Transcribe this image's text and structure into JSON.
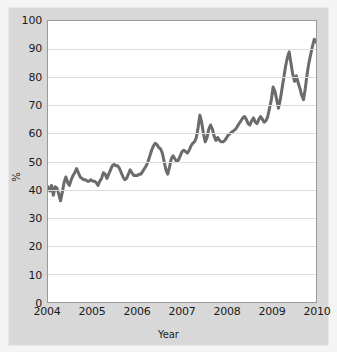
{
  "chart_data": {
    "type": "line",
    "title": "",
    "xlabel": "Year",
    "ylabel": "%",
    "xlim": [
      2004,
      2010
    ],
    "ylim": [
      0,
      100
    ],
    "grid": true,
    "legend": "none",
    "line_color": "#6b6b6b",
    "plot_background": "#ffffff",
    "panel_background": "#d8d8d8",
    "gridline_color": "#dcdcdc",
    "y_ticks": [
      0,
      10,
      20,
      30,
      40,
      50,
      60,
      70,
      80,
      90,
      100
    ],
    "y_tick_labels": [
      "0",
      "10",
      "20",
      "30",
      "40",
      "50",
      "60",
      "70",
      "80",
      "90",
      "100"
    ],
    "x_ticks": [
      2004,
      2005,
      2006,
      2007,
      2008,
      2009,
      2010
    ],
    "x_tick_labels": [
      "2004",
      "2005",
      "2006",
      "2007",
      "2008",
      "2009",
      "2010"
    ],
    "series": [
      {
        "name": "percent",
        "x": [
          2004.0,
          2004.04,
          2004.08,
          2004.12,
          2004.16,
          2004.2,
          2004.24,
          2004.28,
          2004.32,
          2004.36,
          2004.4,
          2004.44,
          2004.48,
          2004.52,
          2004.56,
          2004.6,
          2004.64,
          2004.68,
          2004.72,
          2004.76,
          2004.8,
          2004.84,
          2004.88,
          2004.92,
          2004.96,
          2005.0,
          2005.04,
          2005.08,
          2005.12,
          2005.16,
          2005.2,
          2005.24,
          2005.28,
          2005.32,
          2005.36,
          2005.4,
          2005.44,
          2005.48,
          2005.52,
          2005.56,
          2005.6,
          2005.64,
          2005.68,
          2005.72,
          2005.76,
          2005.8,
          2005.84,
          2005.88,
          2005.92,
          2005.96,
          2006.0,
          2006.04,
          2006.08,
          2006.12,
          2006.16,
          2006.2,
          2006.24,
          2006.28,
          2006.32,
          2006.36,
          2006.4,
          2006.44,
          2006.48,
          2006.52,
          2006.56,
          2006.6,
          2006.64,
          2006.68,
          2006.72,
          2006.76,
          2006.8,
          2006.84,
          2006.88,
          2006.92,
          2006.96,
          2007.0,
          2007.04,
          2007.08,
          2007.12,
          2007.16,
          2007.2,
          2007.24,
          2007.28,
          2007.32,
          2007.36,
          2007.4,
          2007.44,
          2007.48,
          2007.52,
          2007.56,
          2007.6,
          2007.64,
          2007.68,
          2007.72,
          2007.76,
          2007.8,
          2007.84,
          2007.88,
          2007.92,
          2007.96,
          2008.0,
          2008.04,
          2008.08,
          2008.12,
          2008.16,
          2008.2,
          2008.24,
          2008.28,
          2008.32,
          2008.36,
          2008.4,
          2008.44,
          2008.48,
          2008.52,
          2008.56,
          2008.6,
          2008.64,
          2008.68,
          2008.72,
          2008.76,
          2008.8,
          2008.84,
          2008.88,
          2008.92,
          2008.96,
          2009.0,
          2009.04,
          2009.08,
          2009.12,
          2009.16,
          2009.2,
          2009.24,
          2009.28,
          2009.32,
          2009.36,
          2009.4,
          2009.44,
          2009.48,
          2009.52,
          2009.56,
          2009.6,
          2009.64,
          2009.68,
          2009.72,
          2009.76,
          2009.8,
          2009.84,
          2009.88,
          2009.92,
          2009.96,
          2010.0
        ],
        "values": [
          41.0,
          39.5,
          41.5,
          38.0,
          41.0,
          40.5,
          38.5,
          36.0,
          39.0,
          42.5,
          44.5,
          42.5,
          41.5,
          43.5,
          45.0,
          46.0,
          47.5,
          46.0,
          44.5,
          44.0,
          43.5,
          43.5,
          43.0,
          43.0,
          43.5,
          43.0,
          43.0,
          42.5,
          41.5,
          43.0,
          44.0,
          46.0,
          45.5,
          44.0,
          45.5,
          47.0,
          48.5,
          49.0,
          48.5,
          48.5,
          47.5,
          46.0,
          44.5,
          43.5,
          44.0,
          45.5,
          47.0,
          46.0,
          45.0,
          45.0,
          45.0,
          45.5,
          45.5,
          46.5,
          47.5,
          48.5,
          50.0,
          52.0,
          54.0,
          55.5,
          56.5,
          56.0,
          55.0,
          54.5,
          53.0,
          50.0,
          47.0,
          45.5,
          48.0,
          51.0,
          52.0,
          51.0,
          50.0,
          50.5,
          52.0,
          53.5,
          54.0,
          53.5,
          53.0,
          54.0,
          55.5,
          56.5,
          57.0,
          58.5,
          62.0,
          66.5,
          64.0,
          60.0,
          57.0,
          58.5,
          61.5,
          63.0,
          61.5,
          59.0,
          57.5,
          58.5,
          57.5,
          57.0,
          57.0,
          57.5,
          58.5,
          59.5,
          60.0,
          60.5,
          61.0,
          61.5,
          62.5,
          63.5,
          64.5,
          65.5,
          66.0,
          65.0,
          63.5,
          63.0,
          64.5,
          65.5,
          64.0,
          63.5,
          65.0,
          66.0,
          65.0,
          64.0,
          64.5,
          66.0,
          69.0,
          72.0,
          76.5,
          75.0,
          72.0,
          69.0,
          72.0,
          76.0,
          80.0,
          84.0,
          87.0,
          89.0,
          85.0,
          81.0,
          78.5,
          80.5,
          78.0,
          76.0,
          73.5,
          72.0,
          76.0,
          81.0,
          85.0,
          88.0,
          91.0,
          93.5,
          92.5
        ]
      }
    ]
  },
  "axes": {
    "yaxis_title": "%",
    "xaxis_title": "Year"
  }
}
